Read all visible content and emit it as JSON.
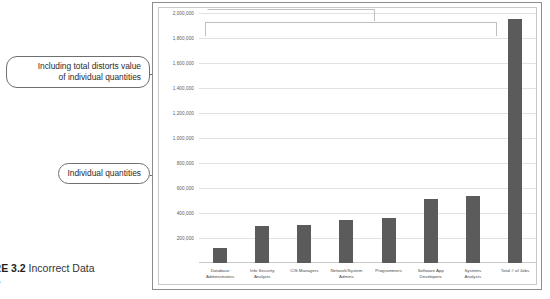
{
  "caption": {
    "label": "URE 3.2",
    "text": " Incorrect Data",
    "line2": "rce"
  },
  "callouts": [
    {
      "id": "total-distorts",
      "text": "Including total distorts value\nof individual quantities"
    },
    {
      "id": "individual-quantities",
      "text": "Individual quantities"
    }
  ],
  "chart_data": {
    "type": "bar",
    "title": "",
    "xlabel": "",
    "ylabel": "",
    "ylim": [
      0,
      2000000
    ],
    "grid": true,
    "legend": "none",
    "ytick_labels": [
      "2,000,000",
      "1,800,000",
      "1,600,000",
      "1,400,000",
      "1,200,000",
      "1,000,000",
      "800,000",
      "600,000",
      "400,000",
      "200,000"
    ],
    "ytick_values": [
      2000000,
      1800000,
      1600000,
      1400000,
      1200000,
      1000000,
      800000,
      600000,
      400000,
      200000
    ],
    "categories": [
      "Database\nAdministrators",
      "Info Security\nAnalysts",
      "CIS Managers",
      "Network/System\nAdmins",
      "Programmers",
      "Software App\nDevelopers",
      "Systems\nAnalysts",
      "Total # of Jobs"
    ],
    "values": [
      120000,
      300000,
      305000,
      345000,
      360000,
      515000,
      540000,
      1950000
    ],
    "bar_color": "#5b5b5b",
    "grid_color": "#e2e2e2",
    "annotations": [
      "Including total distorts value of individual quantities",
      "Individual quantities"
    ]
  }
}
